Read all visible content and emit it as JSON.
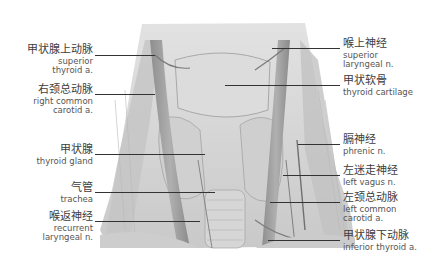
{
  "figure": {
    "type": "anatomical-photograph",
    "image_tone": "grayscale"
  },
  "labels": {
    "left": [
      {
        "zh": "甲状腺上动脉",
        "en": [
          "superior",
          "thyroid a."
        ]
      },
      {
        "zh": "右颈总动脉",
        "en": [
          "right common",
          "carotid a."
        ]
      },
      {
        "zh": "甲状腺",
        "en": [
          "thyroid gland"
        ]
      },
      {
        "zh": "气管",
        "en": [
          "trachea"
        ]
      },
      {
        "zh": "喉返神经",
        "en": [
          "recurrent",
          "laryngeal n."
        ]
      }
    ],
    "right": [
      {
        "zh": "喉上神经",
        "en": [
          "superior",
          "laryngeal n."
        ]
      },
      {
        "zh": "甲状软骨",
        "en": [
          "thyroid cartilage"
        ]
      },
      {
        "zh": "膈神经",
        "en": [
          "phrenic n."
        ]
      },
      {
        "zh": "左迷走神经",
        "en": [
          "left vagus n."
        ]
      },
      {
        "zh": "左颈总动脉",
        "en": [
          "left common",
          "carotid a."
        ]
      },
      {
        "zh": "甲状腺下动脉",
        "en": [
          "inferior thyroid a."
        ]
      }
    ]
  },
  "colors": {
    "background": "#ffffff",
    "tissue_light": "#d8d8d8",
    "tissue_mid": "#b5b5b5",
    "tissue_dark": "#7a7a7a",
    "leader_line": "#333333",
    "text": "#4a4a4a"
  }
}
